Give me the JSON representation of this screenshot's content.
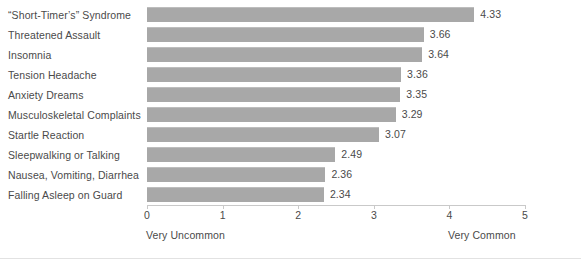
{
  "chart_data": {
    "type": "bar",
    "orientation": "horizontal",
    "title": "",
    "subtitle": "",
    "xlabel": "",
    "ylabel": "",
    "xlim": [
      0,
      5
    ],
    "grid": false,
    "legend": null,
    "bar_color": "#a8a8a8",
    "text_color": "#4a4a4a",
    "axis_color": "#c9c9c9",
    "x_ticks": [
      "0",
      "1",
      "2",
      "3",
      "4",
      "5"
    ],
    "x_tick_values": [
      0,
      1,
      2,
      3,
      4,
      5
    ],
    "axis_endpoint_labels": {
      "low": "Very Uncommon",
      "high": "Very Common"
    },
    "categories": [
      "“Short-Timer’s” Syndrome",
      "Threatened Assault",
      "Insomnia",
      "Tension Headache",
      "Anxiety Dreams",
      "Musculoskeletal Complaints",
      "Startle Reaction",
      "Sleepwalking or Talking",
      "Nausea, Vomiting, Diarrhea",
      "Falling Asleep on Guard"
    ],
    "values": [
      4.33,
      3.66,
      3.64,
      3.36,
      3.35,
      3.29,
      3.07,
      2.49,
      2.36,
      2.34
    ],
    "value_labels": [
      "4.33",
      "3.66",
      "3.64",
      "3.36",
      "3.35",
      "3.29",
      "3.07",
      "2.49",
      "2.36",
      "2.34"
    ]
  }
}
